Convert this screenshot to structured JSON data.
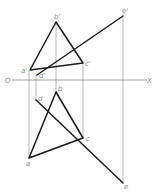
{
  "diagram": {
    "type": "orthographic-projection",
    "axis": {
      "origin_label": "O",
      "end_label": "X"
    },
    "labels": {
      "b_prime": "b'",
      "a_prime": "a'",
      "c_prime": "c'",
      "d_prime": "d'",
      "e_prime": "e'",
      "a": "a",
      "b": "b",
      "c": "c",
      "d": "d",
      "e": "e"
    },
    "elevation_view": {
      "triangle": [
        "a'",
        "b'",
        "c'"
      ],
      "line": [
        "d'",
        "e'"
      ]
    },
    "plan_view": {
      "triangle": [
        "a",
        "b",
        "c"
      ],
      "line": [
        "d",
        "e"
      ]
    },
    "colors": {
      "object_line": "#1a1a1a",
      "projection_line": "#9a9a9a",
      "label": "#8a8a8a"
    }
  }
}
